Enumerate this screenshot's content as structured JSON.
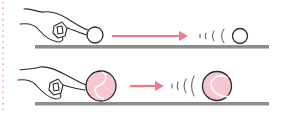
{
  "figure": {
    "colors": {
      "floor": "#8c8c8c",
      "arrow": "#ee7a8a",
      "outline": "#2a2a2a",
      "pink_ball_fill": "#f7c6d0",
      "ball_seam": "#ffffff",
      "left_dots": "#f2a9b8",
      "white_ball_fill": "#ffffff"
    },
    "rows": [
      {
        "name": "light-ball",
        "ball_type": "plain white ball",
        "arrow_length": "long",
        "travel_distance": "far"
      },
      {
        "name": "heavy-ball",
        "ball_type": "pink tennis-style ball",
        "arrow_length": "short",
        "travel_distance": "short"
      }
    ]
  }
}
